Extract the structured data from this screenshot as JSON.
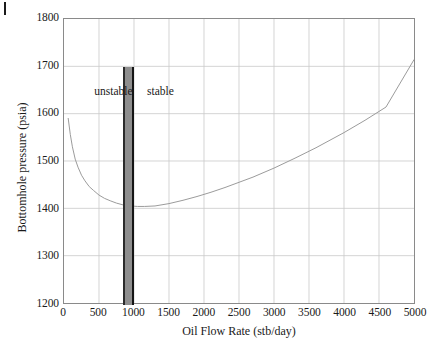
{
  "figure": {
    "corner_mark": "page-edge-mark"
  },
  "chart_data": {
    "type": "line",
    "title": "",
    "xlabel": "Oil Flow Rate (stb/day)",
    "ylabel": "Bottomhole pressure (psia)",
    "xlim": [
      0,
      5000
    ],
    "ylim": [
      1200,
      1800
    ],
    "xticks": [
      0,
      500,
      1000,
      1500,
      2000,
      2500,
      3000,
      3500,
      4000,
      4500,
      5000
    ],
    "yticks": [
      1200,
      1300,
      1400,
      1500,
      1600,
      1700,
      1800
    ],
    "xtick_labels": [
      "0",
      "500",
      "1000",
      "1500",
      "2000",
      "2500",
      "3000",
      "3500",
      "4000",
      "4500",
      "5000"
    ],
    "ytick_labels": [
      "1200",
      "1300",
      "1400",
      "1500",
      "1600",
      "1700",
      "1800"
    ],
    "grid": true,
    "legend": "none",
    "series": [
      {
        "name": "Tubing performance curve",
        "color": "#9a9a9a",
        "x": [
          60,
          90,
          120,
          160,
          200,
          250,
          300,
          360,
          420,
          500,
          580,
          660,
          750,
          850,
          950,
          1050,
          1150,
          1300,
          1500,
          1700,
          1900,
          2100,
          2300,
          2500,
          2700,
          3000,
          3300,
          3600,
          4000,
          4300,
          4600,
          5000
        ],
        "y": [
          1590,
          1556,
          1530,
          1504,
          1487,
          1470,
          1458,
          1446,
          1438,
          1428,
          1421,
          1416,
          1411,
          1407,
          1405,
          1404,
          1404,
          1405,
          1410,
          1417,
          1425,
          1434,
          1444,
          1455,
          1466,
          1485,
          1506,
          1528,
          1560,
          1586,
          1614,
          1714
        ]
      }
    ],
    "annotations": [
      {
        "text": "unstable",
        "x": 430,
        "y": 1650,
        "name": "unstable-region-label"
      },
      {
        "text": "stable",
        "x": 1180,
        "y": 1650,
        "name": "stable-region-label"
      }
    ],
    "region_bar": {
      "name": "stability-boundary-bar",
      "x_start": 840,
      "x_end": 1000,
      "y_top": 1700,
      "y_bottom": 1200,
      "fill_color": "#8e8e8e",
      "edge_color": "#151515"
    }
  }
}
